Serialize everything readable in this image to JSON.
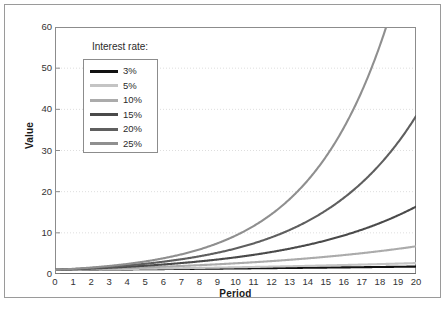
{
  "chart_data": {
    "type": "line",
    "title": "",
    "xlabel": "Period",
    "ylabel": "Value",
    "xlim": [
      0,
      20
    ],
    "ylim": [
      0,
      60
    ],
    "xticks": [
      "0",
      "1",
      "2",
      "3",
      "4",
      "5",
      "6",
      "7",
      "8",
      "9",
      "10",
      "11",
      "12",
      "13",
      "14",
      "15",
      "16",
      "17",
      "18",
      "19",
      "20"
    ],
    "yticks": [
      "0",
      "10",
      "20",
      "30",
      "40",
      "50",
      "60"
    ],
    "grid": "horizontal-dotted",
    "legend_position": "upper-left-inside",
    "legend_title": "Interest rate:",
    "x": [
      0,
      1,
      2,
      3,
      4,
      5,
      6,
      7,
      8,
      9,
      10,
      11,
      12,
      13,
      14,
      15,
      16,
      17,
      18,
      19,
      20
    ],
    "series": [
      {
        "name": "3%",
        "rate": 0.03,
        "color": "#121212",
        "values": [
          1.0,
          1.03,
          1.06,
          1.09,
          1.13,
          1.16,
          1.19,
          1.23,
          1.27,
          1.3,
          1.34,
          1.38,
          1.43,
          1.47,
          1.51,
          1.56,
          1.6,
          1.65,
          1.7,
          1.75,
          1.81
        ]
      },
      {
        "name": "5%",
        "rate": 0.05,
        "color": "#c4c4c4",
        "values": [
          1.0,
          1.05,
          1.1,
          1.16,
          1.22,
          1.28,
          1.34,
          1.41,
          1.48,
          1.55,
          1.63,
          1.71,
          1.8,
          1.89,
          1.98,
          2.08,
          2.18,
          2.29,
          2.41,
          2.53,
          2.65
        ]
      },
      {
        "name": "10%",
        "rate": 0.1,
        "color": "#ababab",
        "values": [
          1.0,
          1.1,
          1.21,
          1.33,
          1.46,
          1.61,
          1.77,
          1.95,
          2.14,
          2.36,
          2.59,
          2.85,
          3.14,
          3.45,
          3.8,
          4.18,
          4.59,
          5.05,
          5.56,
          6.12,
          6.73
        ]
      },
      {
        "name": "15%",
        "rate": 0.15,
        "color": "#4a4a4a",
        "values": [
          1.0,
          1.15,
          1.32,
          1.52,
          1.75,
          2.01,
          2.31,
          2.66,
          3.06,
          3.52,
          4.05,
          4.65,
          5.35,
          6.15,
          7.08,
          8.14,
          9.36,
          10.76,
          12.38,
          14.23,
          16.37
        ]
      },
      {
        "name": "20%",
        "rate": 0.2,
        "color": "#5f5f5f",
        "values": [
          1.0,
          1.2,
          1.44,
          1.73,
          2.07,
          2.49,
          2.99,
          3.58,
          4.3,
          5.16,
          6.19,
          7.43,
          8.92,
          10.7,
          12.84,
          15.41,
          18.49,
          22.19,
          26.62,
          31.95,
          38.34
        ]
      },
      {
        "name": "25%",
        "rate": 0.25,
        "color": "#8f8f8f",
        "values": [
          1.0,
          1.25,
          1.56,
          1.95,
          2.44,
          3.05,
          3.81,
          4.77,
          5.96,
          7.45,
          9.31,
          11.64,
          14.55,
          18.19,
          22.74,
          28.42,
          35.53,
          44.41,
          55.51,
          69.39,
          86.74
        ]
      }
    ]
  }
}
